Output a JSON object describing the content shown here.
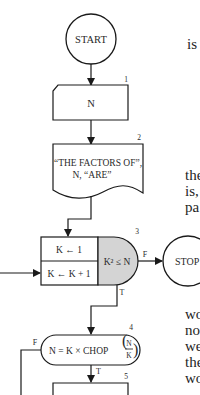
{
  "flowchart": {
    "start": {
      "label": "START"
    },
    "step1": {
      "number": "1",
      "label": "N"
    },
    "step2": {
      "number": "2",
      "line1": "“THE FACTORS OF”,",
      "line2": "N, “ARE”"
    },
    "step3": {
      "number": "3",
      "init": "K ← 1",
      "increment": "K ← K + 1",
      "condition": "K² ≤ N",
      "false_label": "F",
      "true_label": "T"
    },
    "stop": {
      "label": "STOP"
    },
    "step4": {
      "number": "4",
      "condition_prefix": "N = K × CHOP",
      "frac_num": "N",
      "frac_den": "K",
      "false_label": "F",
      "true_label": "T"
    },
    "step5": {
      "number": "5"
    },
    "colors": {
      "line": "#1a1a1a",
      "decision_fill": "#d4d4d4",
      "background": "#ffffff"
    }
  },
  "prose_fragments": {
    "top": [
      "is"
    ],
    "middle": [
      "the",
      "is,",
      "pa"
    ],
    "bottom": [
      "wo",
      "no",
      "we",
      "the",
      "wo"
    ]
  }
}
